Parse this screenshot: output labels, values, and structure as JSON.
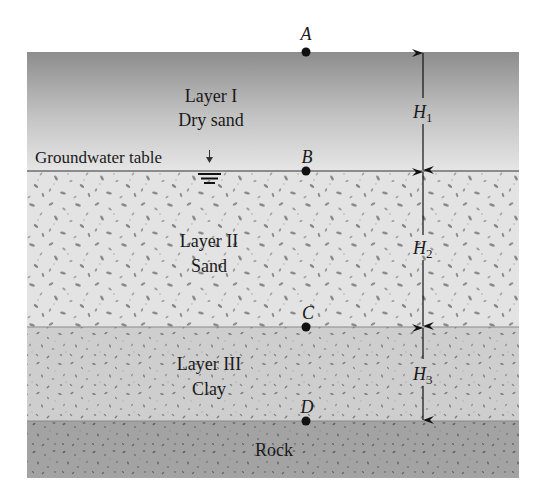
{
  "diagram": {
    "type": "soil-profile",
    "layers": [
      {
        "id": "layer-1",
        "title": "Layer I",
        "material": "Dry sand",
        "top": 52,
        "bottom": 171,
        "fill_top": "#8c8c8c",
        "fill_bottom": "#e2e2e2"
      },
      {
        "id": "layer-2",
        "title": "Layer II",
        "material": "Sand",
        "top": 171,
        "bottom": 327,
        "fill": "#e4e4e4",
        "speck": "#8a8a8a"
      },
      {
        "id": "layer-3",
        "title": "Layer III",
        "material": "Clay",
        "top": 327,
        "bottom": 421,
        "fill": "#cfcfcf",
        "speck": "#7a7a7a"
      },
      {
        "id": "rock",
        "title": "",
        "material": "Rock",
        "top": 421,
        "bottom": 478,
        "fill": "#a2a2a2",
        "speck": "#666666"
      }
    ],
    "groundwater_label": "Groundwater table",
    "points": [
      {
        "name": "A",
        "y": 52
      },
      {
        "name": "B",
        "y": 171
      },
      {
        "name": "C",
        "y": 327
      },
      {
        "name": "D",
        "y": 421
      }
    ],
    "dimensions": [
      {
        "symbol": "H",
        "subscript": "1",
        "from": "A",
        "to": "B"
      },
      {
        "symbol": "H",
        "subscript": "2",
        "from": "B",
        "to": "C"
      },
      {
        "symbol": "H",
        "subscript": "3",
        "from": "C",
        "to": "D"
      }
    ],
    "labels": {
      "a": "A",
      "b": "B",
      "c": "C",
      "d": "D",
      "h": "H",
      "h1_sub": "1",
      "h2_sub": "2",
      "h3_sub": "3",
      "layer1_title": "Layer I",
      "layer1_material": "Dry sand",
      "layer2_title": "Layer II",
      "layer2_material": "Sand",
      "layer3_title": "Layer III",
      "layer3_material": "Clay",
      "rock": "Rock",
      "groundwater": "Groundwater table"
    },
    "colors": {
      "boundary_line": "#6e6e6e",
      "point": "#111111",
      "arrow": "#111111"
    }
  }
}
